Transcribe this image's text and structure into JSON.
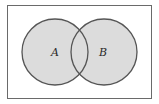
{
  "diagram": {
    "type": "venn",
    "universe": {
      "x": 7,
      "y": 5,
      "width": 145,
      "height": 94,
      "stroke": "#6a6a6a"
    },
    "sets": [
      {
        "label": "A",
        "cx": 55,
        "cy": 52,
        "r": 33,
        "fill": "#dcdcdc",
        "stroke": "#555555"
      },
      {
        "label": "B",
        "cx": 104,
        "cy": 52,
        "r": 33,
        "fill": "#dcdcdc",
        "stroke": "#555555"
      }
    ],
    "shaded": "A ∪ B"
  }
}
